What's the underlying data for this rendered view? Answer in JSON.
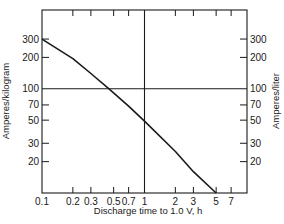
{
  "chart_data": {
    "type": "line",
    "title": "",
    "xlabel": "Discharge time to 1.0 V, h",
    "ylabel": "Amperes/kilogram",
    "ylabel_right": "Amperes/liter",
    "xscale": "log",
    "yscale": "log",
    "xlim": [
      0.1,
      10
    ],
    "ylim": [
      10,
      570
    ],
    "x_ticks": [
      0.1,
      0.2,
      0.3,
      0.5,
      0.7,
      1,
      2,
      3,
      5,
      7
    ],
    "x_tick_labels": [
      "0.1",
      "0.2",
      "0.3",
      "0.5",
      "0.7",
      "1",
      "2",
      "3",
      "5",
      "7"
    ],
    "y_ticks_left": [
      20,
      30,
      50,
      70,
      100,
      200,
      300
    ],
    "y_tick_labels_left": [
      "20",
      "30",
      "50",
      "70",
      "100",
      "200",
      "300"
    ],
    "y_ticks_right": [
      20,
      30,
      50,
      70,
      100,
      200,
      300
    ],
    "y_tick_labels_right": [
      "20",
      "30",
      "50",
      "70",
      "100",
      "200",
      "300"
    ],
    "reference_lines": {
      "horizontal_y": 100,
      "vertical_x": 1
    },
    "grid": false,
    "legend": null,
    "series": [
      {
        "name": "Discharge rate",
        "x": [
          0.1,
          0.2,
          0.3,
          0.45,
          0.7,
          1,
          2,
          3,
          5
        ],
        "values": [
          300,
          195,
          140,
          100,
          68,
          49,
          25,
          16,
          10
        ]
      }
    ]
  }
}
